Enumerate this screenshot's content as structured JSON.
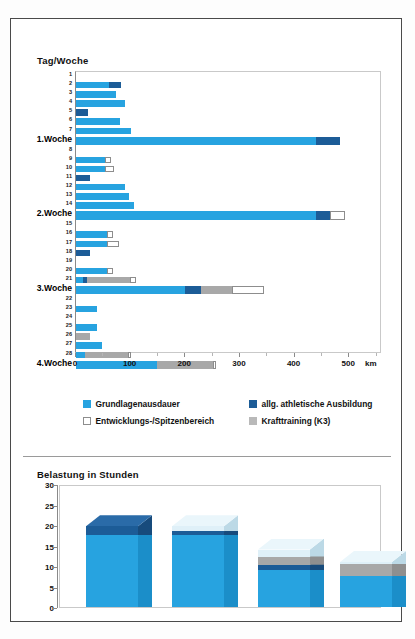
{
  "top_chart": {
    "title": "Tag/Woche",
    "x_unit": "km",
    "x_ticks": [
      0,
      100,
      200,
      300,
      400,
      500
    ],
    "legend": [
      {
        "key": "gla",
        "label": "Grundlagenausdauer",
        "color": "#27a3e0"
      },
      {
        "key": "ath",
        "label": "allg. athletische Ausbildung",
        "color": "#1c5c97"
      },
      {
        "key": "ent",
        "label": "Entwicklungs-/Spitzenbereich",
        "color": "#ffffff"
      },
      {
        "key": "kra",
        "label": "Krafttraining (K3)",
        "color": "#b9b9b9"
      }
    ]
  },
  "bottom_chart": {
    "title": "Belastung in Stunden",
    "y_ticks": [
      0,
      5,
      10,
      15,
      20,
      25,
      30
    ]
  },
  "chart_data": [
    {
      "type": "bar",
      "orientation": "horizontal",
      "stacked": true,
      "title": "Tag/Woche",
      "xlabel": "km",
      "ylabel": "Tag/Woche",
      "xlim": [
        0,
        560
      ],
      "grid": false,
      "legend_position": "below",
      "series": [
        {
          "name": "Grundlagenausdauer",
          "color": "#27a3e0"
        },
        {
          "name": "allg. athletische Ausbildung",
          "color": "#1c5c97"
        },
        {
          "name": "Entwicklungs-/Spitzenbereich",
          "color": "#ffffff"
        },
        {
          "name": "Krafttraining (K3)",
          "color": "#a8a8a8"
        }
      ],
      "categories": [
        "1",
        "2",
        "3",
        "4",
        "5",
        "6",
        "7",
        "1.Woche",
        "8",
        "9",
        "10",
        "11",
        "12",
        "13",
        "14",
        "2.Woche",
        "15",
        "16",
        "17",
        "18",
        "19",
        "20",
        "21",
        "3.Woche",
        "22",
        "23",
        "24",
        "25",
        "26",
        "27",
        "28",
        "4.Woche"
      ],
      "rows": [
        {
          "label": "1",
          "week": false,
          "gla": 0,
          "ath": 0,
          "ent": 0,
          "kra": 0
        },
        {
          "label": "2",
          "week": false,
          "gla": 60,
          "ath": 22,
          "ent": 0,
          "kra": 0
        },
        {
          "label": "3",
          "week": false,
          "gla": 73,
          "ath": 0,
          "ent": 0,
          "kra": 0
        },
        {
          "label": "4",
          "week": false,
          "gla": 90,
          "ath": 0,
          "ent": 0,
          "kra": 0
        },
        {
          "label": "5",
          "week": false,
          "gla": 0,
          "ath": 22,
          "ent": 0,
          "kra": 0
        },
        {
          "label": "6",
          "week": false,
          "gla": 80,
          "ath": 0,
          "ent": 0,
          "kra": 0
        },
        {
          "label": "7",
          "week": false,
          "gla": 100,
          "ath": 0,
          "ent": 0,
          "kra": 0
        },
        {
          "label": "1.Woche",
          "week": true,
          "gla": 440,
          "ath": 44,
          "ent": 0,
          "kra": 0
        },
        {
          "label": "8",
          "week": false,
          "gla": 0,
          "ath": 0,
          "ent": 0,
          "kra": 0
        },
        {
          "label": "9",
          "week": false,
          "gla": 53,
          "ath": 0,
          "ent": 11,
          "kra": 0
        },
        {
          "label": "10",
          "week": false,
          "gla": 53,
          "ath": 0,
          "ent": 16,
          "kra": 0
        },
        {
          "label": "11",
          "week": false,
          "gla": 0,
          "ath": 25,
          "ent": 0,
          "kra": 0
        },
        {
          "label": "12",
          "week": false,
          "gla": 90,
          "ath": 0,
          "ent": 0,
          "kra": 0
        },
        {
          "label": "13",
          "week": false,
          "gla": 97,
          "ath": 0,
          "ent": 0,
          "kra": 0
        },
        {
          "label": "14",
          "week": false,
          "gla": 107,
          "ath": 0,
          "ent": 0,
          "kra": 0
        },
        {
          "label": "2.Woche",
          "week": true,
          "gla": 440,
          "ath": 25,
          "ent": 27,
          "kra": 0
        },
        {
          "label": "15",
          "week": false,
          "gla": 0,
          "ath": 0,
          "ent": 0,
          "kra": 0
        },
        {
          "label": "16",
          "week": false,
          "gla": 56,
          "ath": 0,
          "ent": 11,
          "kra": 0
        },
        {
          "label": "17",
          "week": false,
          "gla": 56,
          "ath": 0,
          "ent": 22,
          "kra": 0
        },
        {
          "label": "18",
          "week": false,
          "gla": 0,
          "ath": 25,
          "ent": 0,
          "kra": 0
        },
        {
          "label": "19",
          "week": false,
          "gla": 0,
          "ath": 0,
          "ent": 0,
          "kra": 0
        },
        {
          "label": "20",
          "week": false,
          "gla": 56,
          "ath": 0,
          "ent": 11,
          "kra": 0
        },
        {
          "label": "21",
          "week": false,
          "gla": 12,
          "ath": 8,
          "ent": 11,
          "kra": 78
        },
        {
          "label": "3.Woche",
          "week": true,
          "gla": 200,
          "ath": 28,
          "ent": 58,
          "kra": 58
        },
        {
          "label": "22",
          "week": false,
          "gla": 0,
          "ath": 0,
          "ent": 0,
          "kra": 0
        },
        {
          "label": "23",
          "week": false,
          "gla": 38,
          "ath": 0,
          "ent": 0,
          "kra": 0
        },
        {
          "label": "24",
          "week": false,
          "gla": 0,
          "ath": 0,
          "ent": 0,
          "kra": 0
        },
        {
          "label": "25",
          "week": false,
          "gla": 38,
          "ath": 0,
          "ent": 0,
          "kra": 0
        },
        {
          "label": "26",
          "week": false,
          "gla": 0,
          "ath": 0,
          "ent": 0,
          "kra": 25
        },
        {
          "label": "27",
          "week": false,
          "gla": 47,
          "ath": 0,
          "ent": 0,
          "kra": 0
        },
        {
          "label": "28",
          "week": false,
          "gla": 17,
          "ath": 0,
          "ent": 6,
          "kra": 78
        },
        {
          "label": "4.Woche",
          "week": true,
          "gla": 148,
          "ath": 0,
          "ent": 6,
          "kra": 103
        }
      ]
    },
    {
      "type": "bar",
      "orientation": "vertical",
      "stacked": true,
      "style": "3d",
      "title": "Belastung in Stunden",
      "xlabel": "",
      "ylabel": "Stunden",
      "ylim": [
        0,
        30
      ],
      "grid": false,
      "categories": [
        "1.Woche",
        "2.Woche",
        "3.Woche",
        "4.Woche"
      ],
      "series": [
        {
          "name": "Grundlagenausdauer",
          "color": "#27a3e0",
          "values": [
            17.5,
            17.5,
            9.0,
            7.5
          ]
        },
        {
          "name": "allg. athletische Ausbildung",
          "color": "#1c5c97",
          "values": [
            2.2,
            1.0,
            1.3,
            0.0
          ]
        },
        {
          "name": "Krafttraining (K3)",
          "color": "#a8a8a8",
          "values": [
            0.0,
            0.0,
            2.0,
            3.0
          ]
        },
        {
          "name": "Entwicklungs-/Spitzenbereich",
          "color": "#dff0f8",
          "values": [
            0.0,
            1.2,
            1.7,
            0.5
          ]
        }
      ],
      "totals": [
        19.7,
        19.7,
        14.0,
        11.0
      ]
    }
  ]
}
